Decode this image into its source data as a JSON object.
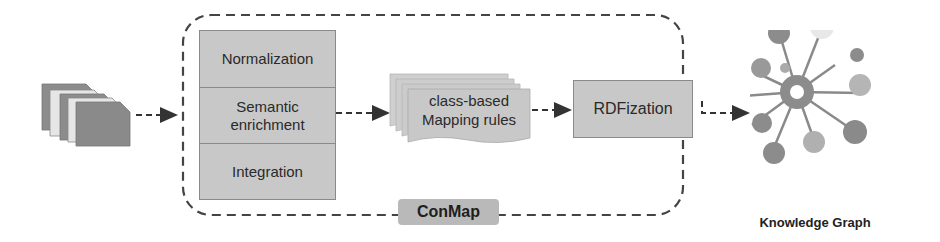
{
  "diagram": {
    "input": {
      "name": "input-documents",
      "icon": "document-stack-icon"
    },
    "container": {
      "label": "ConMap"
    },
    "processing_stack": {
      "steps": [
        {
          "label": "Normalization"
        },
        {
          "label": "Semantic enrichment"
        },
        {
          "label": "Integration"
        }
      ]
    },
    "mapping_rules": {
      "line1": "class-based",
      "line2": "Mapping rules",
      "icon": "stacked-pages-icon"
    },
    "rdfization": {
      "label": "RDFization"
    },
    "output": {
      "label": "Knowledge Graph",
      "icon": "knowledge-graph-icon"
    },
    "colors": {
      "box_fill": "#c8c8c8",
      "box_border": "#8a8a8a",
      "doc_dark": "#8c8c8c",
      "doc_light": "#e6e6e6",
      "dash": "#444444",
      "badge": "#b9b9b9"
    }
  }
}
